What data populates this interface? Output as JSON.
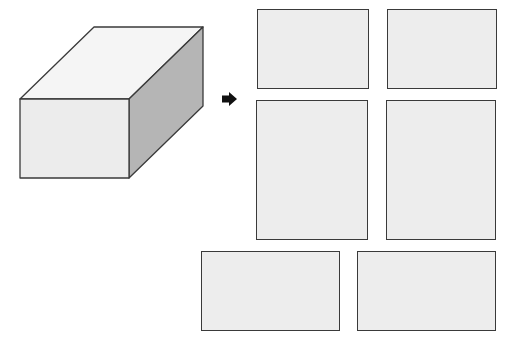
{
  "diagram": {
    "title": "",
    "colors": {
      "stroke": "#3a3a3a",
      "front_face": "#ececec",
      "top_face": "#f5f5f5",
      "side_face": "#b5b5b5",
      "net_face": "#ededed",
      "arrow": "#111111"
    },
    "solid": {
      "name": "rectangular-prism",
      "front": {
        "x": 20,
        "y": 99,
        "w": 109,
        "h": 79
      },
      "depth_offset": {
        "dx": 74,
        "dy": -72
      }
    },
    "arrow": {
      "symbol": "➡",
      "x": 222,
      "y": 92
    },
    "faces": [
      {
        "name": "face-top-left",
        "x": 257,
        "y": 9,
        "w": 112,
        "h": 80
      },
      {
        "name": "face-top-right",
        "x": 387,
        "y": 9,
        "w": 110,
        "h": 80
      },
      {
        "name": "face-middle-left",
        "x": 256,
        "y": 100,
        "w": 112,
        "h": 140
      },
      {
        "name": "face-middle-right",
        "x": 386,
        "y": 100,
        "w": 110,
        "h": 140
      },
      {
        "name": "face-bottom-left",
        "x": 201,
        "y": 251,
        "w": 139,
        "h": 80
      },
      {
        "name": "face-bottom-right",
        "x": 357,
        "y": 251,
        "w": 139,
        "h": 80
      }
    ]
  }
}
